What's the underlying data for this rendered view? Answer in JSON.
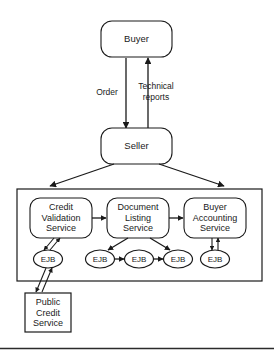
{
  "diagram": {
    "type": "block-flow-diagram",
    "colors": {
      "stroke": "#1a1a1a",
      "background": "#ffffff",
      "text": "#1a1a1a",
      "footer_rule": "#2b2b2b"
    },
    "actors": {
      "buyer": {
        "label": "Buyer",
        "shape": "rounded-rectangle"
      },
      "seller": {
        "label": "Seller",
        "shape": "rounded-rectangle"
      }
    },
    "edge_labels": {
      "order": "Order",
      "technical_reports_line1": "Technical",
      "technical_reports_line2": "reports"
    },
    "services": [
      {
        "id": "credit-validation-service",
        "line1": "Credit",
        "line2": "Validation",
        "line3": "Service"
      },
      {
        "id": "document-listing-service",
        "line1": "Document",
        "line2": "Listing",
        "line3": "Service"
      },
      {
        "id": "buyer-accounting-service",
        "line1": "Buyer",
        "line2": "Accounting",
        "line3": "Service"
      }
    ],
    "ejbs": [
      {
        "id": "ejb-credit-validation",
        "label": "EJB"
      },
      {
        "id": "ejb-document-listing-1",
        "label": "EJB"
      },
      {
        "id": "ejb-document-listing-2",
        "label": "EJB"
      },
      {
        "id": "ejb-document-listing-3",
        "label": "EJB"
      },
      {
        "id": "ejb-buyer-accounting",
        "label": "EJB"
      }
    ],
    "external": {
      "public_credit_service": {
        "id": "public-credit-service",
        "line1": "Public",
        "line2": "Credit",
        "line3": "Service",
        "shape": "rectangle"
      }
    },
    "connections": [
      {
        "from": "Buyer",
        "to": "Seller",
        "label": "Order",
        "direction": "down"
      },
      {
        "from": "Seller",
        "to": "Buyer",
        "label": "Technical reports",
        "direction": "up"
      },
      {
        "from": "Seller",
        "to": "service-container-left",
        "label": "",
        "direction": "down-left"
      },
      {
        "from": "Seller",
        "to": "service-container-right",
        "label": "",
        "direction": "down-right"
      },
      {
        "from": "Credit Validation Service",
        "to": "Document Listing Service",
        "label": "",
        "direction": "right"
      },
      {
        "from": "Document Listing Service",
        "to": "Buyer Accounting Service",
        "label": "",
        "direction": "right"
      },
      {
        "from": "Credit Validation Service",
        "to": "EJB",
        "label": "",
        "direction": "bidirectional"
      },
      {
        "from": "EJB",
        "to": "Public Credit Service",
        "label": "",
        "direction": "bidirectional"
      },
      {
        "from": "Document Listing Service",
        "to": "EJB",
        "label": "",
        "direction": "down-left"
      },
      {
        "from": "Document Listing Service",
        "to": "EJB",
        "label": "",
        "direction": "down-right"
      },
      {
        "from": "EJB",
        "to": "EJB",
        "label": "",
        "direction": "right"
      },
      {
        "from": "EJB",
        "to": "EJB",
        "label": "",
        "direction": "right"
      },
      {
        "from": "Buyer Accounting Service",
        "to": "EJB",
        "label": "",
        "direction": "bidirectional"
      }
    ]
  }
}
